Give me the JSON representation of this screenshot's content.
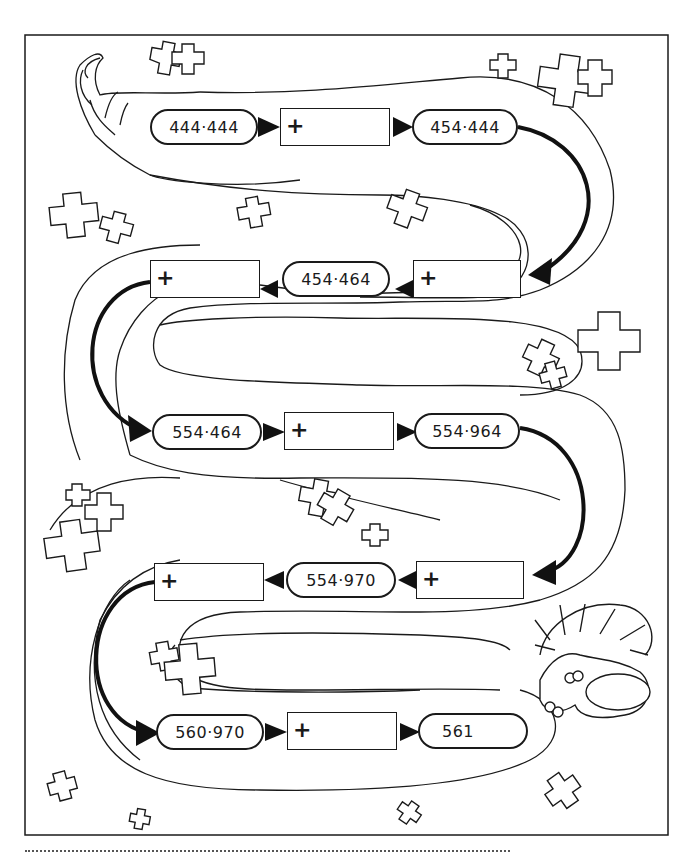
{
  "worksheet": {
    "type": "addition chain puzzle",
    "operator_symbol": "+",
    "rows": [
      {
        "direction": "right",
        "start": "444·444",
        "operation_box": "+",
        "end": "454·444"
      },
      {
        "direction": "left",
        "start": "454·444",
        "operation_box": "+",
        "end": "454·464",
        "next_box": "+"
      },
      {
        "direction": "right",
        "start": "554·464",
        "operation_box": "+",
        "end": "554·964"
      },
      {
        "direction": "left",
        "start": "554·964",
        "operation_box": "+",
        "end": "554·970",
        "next_box": "+"
      },
      {
        "direction": "right",
        "start": "560·970",
        "operation_box": "+",
        "end": "561"
      }
    ],
    "pills": {
      "r1_start": "444·444",
      "r1_end": "454·444",
      "r2_mid": "454·464",
      "r3_start": "554·464",
      "r3_end": "554·964",
      "r4_mid": "554·970",
      "r5_start": "560·970",
      "r5_end": "561"
    },
    "boxes": {
      "b1": "+",
      "b2": "+",
      "b3": "+",
      "b4": "+",
      "b5": "+",
      "b6": "+",
      "b7": "+"
    },
    "answer_line": "",
    "illustration": "serpent/worm body winding through the puzzle with a shaggy-haired head at the lower right and a horn-shaped tail at the top left, with scattered plus-sign decorations"
  }
}
